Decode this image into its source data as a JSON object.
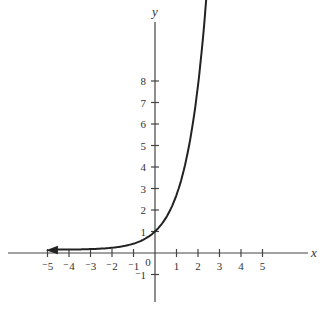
{
  "chart_data": {
    "type": "line",
    "title": "",
    "xlabel": "x",
    "ylabel": "y",
    "xlim": [
      -6.8,
      7.2
    ],
    "ylim": [
      -2.2,
      10.6
    ],
    "grid": false,
    "legend": null,
    "x_ticks": [
      -5,
      -4,
      -3,
      -2,
      -1,
      1,
      2,
      3,
      4,
      5
    ],
    "x_tick_labels": [
      "⁻5",
      "⁻4",
      "⁻3",
      "⁻2",
      "⁻1",
      "1",
      "2",
      "3",
      "4",
      "5"
    ],
    "y_ticks": [
      -1,
      1,
      2,
      3,
      4,
      5,
      6,
      7,
      8
    ],
    "y_tick_labels": [
      "⁻1",
      "1",
      "2",
      "3",
      "4",
      "5",
      "6",
      "7",
      "8"
    ],
    "origin_label": "0",
    "series": [
      {
        "name": "y = 3^x",
        "function": "3^x",
        "x": [
          -5,
          -4,
          -3,
          -2,
          -1,
          0,
          0.5,
          1,
          1.5,
          2
        ],
        "y": [
          0.004,
          0.012,
          0.037,
          0.111,
          0.333,
          1,
          1.732,
          3,
          5.196,
          9
        ],
        "arrows": [
          "left",
          "up"
        ],
        "color": "#222222"
      }
    ]
  }
}
